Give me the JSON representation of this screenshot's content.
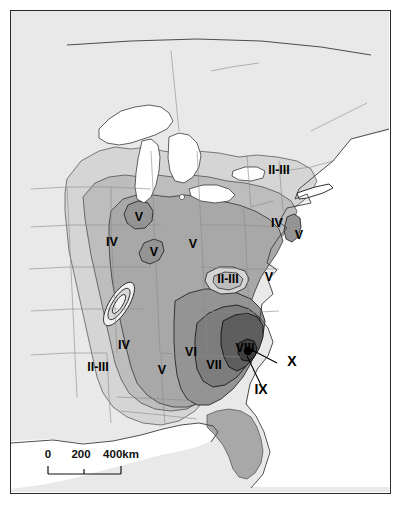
{
  "map": {
    "type": "isoseismal-intensity-map",
    "region": "Eastern United States",
    "epicenter_marker": "epicenter-dot",
    "scale_bar": {
      "ticks": [
        "0",
        "200",
        "400km"
      ],
      "unit": "km",
      "max_value": 400
    },
    "intensity_labels": [
      {
        "id": "ne-2-3",
        "text": "II-III",
        "x": 268,
        "y": 163
      },
      {
        "id": "mid-atl-4",
        "text": "IV",
        "x": 266,
        "y": 216
      },
      {
        "id": "coastal-5",
        "text": "V",
        "x": 288,
        "y": 228
      },
      {
        "id": "upper-mw-5",
        "text": "V",
        "x": 128,
        "y": 210
      },
      {
        "id": "midwest-4",
        "text": "IV",
        "x": 101,
        "y": 235
      },
      {
        "id": "il-5",
        "text": "V",
        "x": 143,
        "y": 245
      },
      {
        "id": "central-5",
        "text": "V",
        "x": 182,
        "y": 237
      },
      {
        "id": "appalachia-2-3",
        "text": "II-III",
        "x": 217,
        "y": 272
      },
      {
        "id": "piedmont-5",
        "text": "V",
        "x": 258,
        "y": 270
      },
      {
        "id": "west-2-3",
        "text": "II-III",
        "x": 87,
        "y": 360
      },
      {
        "id": "west-4",
        "text": "IV",
        "x": 113,
        "y": 338
      },
      {
        "id": "south-5",
        "text": "V",
        "x": 151,
        "y": 363
      },
      {
        "id": "south-6",
        "text": "VI",
        "x": 180,
        "y": 345
      },
      {
        "id": "south-7",
        "text": "VII",
        "x": 203,
        "y": 358
      },
      {
        "id": "south-8",
        "text": "VIII",
        "x": 234,
        "y": 341
      }
    ],
    "callout_labels": [
      {
        "id": "intensity-x",
        "text": "X",
        "x": 281,
        "y": 355
      },
      {
        "id": "intensity-ix",
        "text": "IX",
        "x": 250,
        "y": 383
      }
    ],
    "colors": {
      "background": "#e9e9e9",
      "zone_2_3": "#d5d5d5",
      "zone_4": "#bdbdbd",
      "zone_5": "#a8a8a8",
      "zone_6": "#949494",
      "zone_7": "#7d7d7d",
      "zone_8": "#5e5e5e",
      "zone_9": "#3f3f3f",
      "water": "#ffffff",
      "outline": "#555555",
      "contour": "#1a1a1a",
      "frame": "#2b2b2b"
    }
  }
}
